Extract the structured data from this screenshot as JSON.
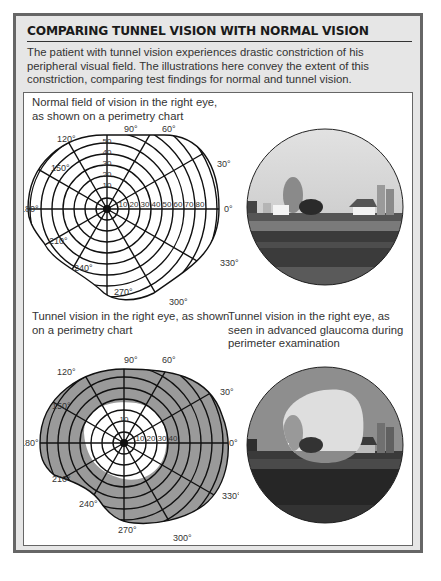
{
  "header": {
    "title": "COMPARING TUNNEL VISION WITH NORMAL VISION",
    "intro": "The patient with tunnel vision experiences drastic constriction of his peripheral visual field. The illustrations here convey the extent of this constriction, comparing test findings for normal and tunnel vision."
  },
  "figures": {
    "normal_chart": {
      "caption": "Normal field of vision in the right eye, as shown on a perimetry chart",
      "angle_labels": [
        "0°",
        "30°",
        "60°",
        "90°",
        "120°",
        "150°",
        "180°",
        "210°",
        "240°",
        "270°",
        "300°",
        "330°"
      ],
      "ring_labels_vertical": [
        "10",
        "20",
        "30",
        "40",
        "50"
      ],
      "ring_labels_horizontal": [
        "10",
        "20",
        "30",
        "40",
        "50",
        "60",
        "70",
        "80"
      ]
    },
    "normal_photo": {
      "caption": "",
      "description": "Rural farm scene with barn and silos, full circular view"
    },
    "tunnel_chart": {
      "caption": "Tunnel vision in the right eye, as shown on a perimetry chart",
      "angle_labels": [
        "0°",
        "30°",
        "60°",
        "90°",
        "120°",
        "150°",
        "180°",
        "210°",
        "240°",
        "270°",
        "300°",
        "330°"
      ],
      "ring_labels_vertical": [
        "10"
      ],
      "ring_labels_horizontal": [
        "10",
        "20",
        "30",
        "40"
      ]
    },
    "tunnel_photo": {
      "caption": "Tunnel vision in the right eye, as seen in advanced glaucoma during perimeter examination",
      "description": "Same farm scene darkened except a small central visible area"
    }
  },
  "colors": {
    "frame_bg": "#e6e6e6",
    "frame_border": "#666666",
    "defect_gray": "#9a9a9a",
    "line": "#111111"
  }
}
